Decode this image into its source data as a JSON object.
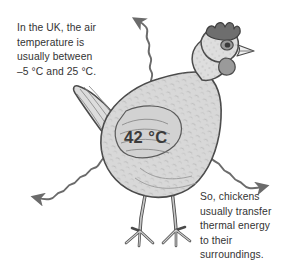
{
  "figure": {
    "background_color": "#ffffff"
  },
  "captions": {
    "top": "In the UK, the air\ntemperature is\nusually between\n–5 °C and 25 °C.",
    "bottom": "So, chickens\nusually transfer\nthermal energy\nto their\nsurroundings."
  },
  "body_temperature": {
    "label": "42 °C",
    "value": 42,
    "unit": "°C",
    "color": "#3b3b3b"
  },
  "arrows": [
    {
      "name": "thermal-arrow-up",
      "direction": "up",
      "style": "wavy"
    },
    {
      "name": "thermal-arrow-left",
      "direction": "down-left",
      "style": "wavy"
    },
    {
      "name": "thermal-arrow-right",
      "direction": "down-right",
      "style": "wavy"
    }
  ],
  "illustration": {
    "subject": "chicken",
    "parts": [
      "comb",
      "eye",
      "beak",
      "wattle",
      "neck",
      "body",
      "wing",
      "tail",
      "legs",
      "feet"
    ],
    "outline_color": "#4a4a4a",
    "body_fill": "#d8d8d8",
    "comb_fill": "#6e6e6e",
    "wattle_fill": "#9a9a9a"
  }
}
